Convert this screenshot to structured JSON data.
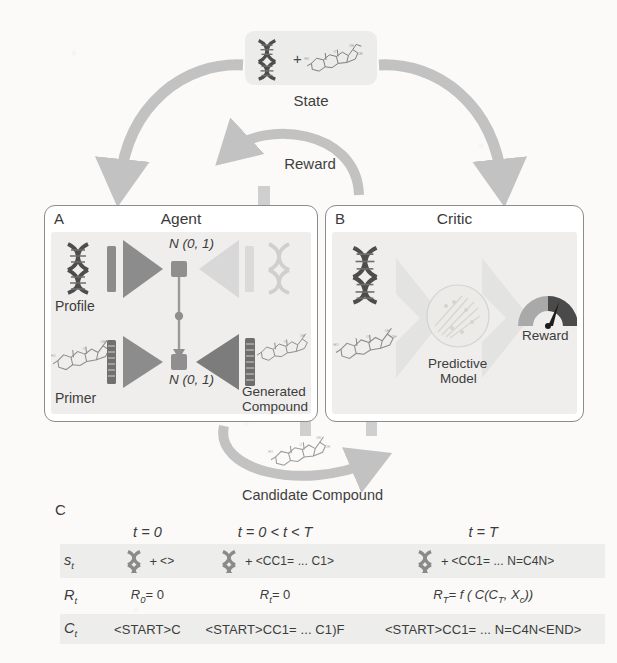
{
  "figure": {
    "state": {
      "label": "State",
      "icons": [
        "dna-helix-icon",
        "plus-sign",
        "steroid-molecule-icon"
      ]
    },
    "arrows": {
      "reward_label": "Reward",
      "candidate_label": "Candidate Compound",
      "state_to_agent": "state-to-agent-arrow",
      "state_to_critic": "state-to-critic-arrow",
      "critic_to_agent": "reward-arc-arrow",
      "agent_to_critic": "candidate-compound-arc-arrow"
    },
    "panel_a": {
      "letter": "A",
      "title": "Agent",
      "profile_label": "Profile",
      "primer_label": "Primer",
      "generated_label_line1": "Generated",
      "generated_label_line2": "Compound",
      "latent_top": "N (0, 1)",
      "latent_bottom": "N (0, 1)",
      "icons": [
        "dna-helix-icon",
        "steroid-molecule-icon",
        "encoder-triangle",
        "decoder-triangle",
        "embedding-bar"
      ]
    },
    "panel_b": {
      "letter": "B",
      "title": "Critic",
      "model_label_line1": "Predictive",
      "model_label_line2": "Model",
      "reward_label": "Reward",
      "icons": [
        "dna-helix-icon",
        "steroid-molecule-icon",
        "chevron-arrow",
        "scatter-circle-icon",
        "gauge-icon"
      ]
    },
    "panel_c": {
      "letter": "C",
      "columns": [
        {
          "header_t": "t",
          "header_eq": "= 0"
        },
        {
          "header_t": "t",
          "header_eq": "= 0 < t < T"
        },
        {
          "header_t": "t",
          "header_eq": "= T"
        }
      ],
      "rows": [
        {
          "label_main": "s",
          "label_sub": "t",
          "cells": [
            {
              "icon": "dna-helix-icon",
              "plus": "+",
              "smiles": "<>"
            },
            {
              "icon": "dna-helix-icon",
              "plus": "+",
              "smiles": "<CC1= ... C1>"
            },
            {
              "icon": "dna-helix-icon",
              "plus": "+",
              "smiles": "<CC1= ... N=C4N>"
            }
          ]
        },
        {
          "label_main": "R",
          "label_sub": "t",
          "cells": [
            {
              "text_main": "R",
              "text_sub": "0",
              "text_tail": "= 0"
            },
            {
              "text_main": "R",
              "text_sub": "t",
              "text_tail": "= 0"
            },
            {
              "text_main": "R",
              "text_sub": "T",
              "text_tail": "= f ( C(C",
              "text_sub2": "T",
              "text_tail2": ", X",
              "text_sub3": "c",
              "text_tail3": "))"
            }
          ]
        },
        {
          "label_main": "C",
          "label_sub": "t",
          "cells": [
            {
              "smiles": "<START>C"
            },
            {
              "smiles": "<START>CC1= ... C1)F"
            },
            {
              "smiles": "<START>CC1= ... N=C4N<END>"
            }
          ]
        }
      ]
    },
    "colors": {
      "arrow_gray": "#c2c2c2",
      "dark_gray": "#808080",
      "light_gray": "#d6d6d6",
      "panel_body": "#efeeec",
      "text": "#3b3b3b",
      "gauge_dark": "#4a4a4a",
      "gauge_light": "#a9a9a9"
    }
  }
}
